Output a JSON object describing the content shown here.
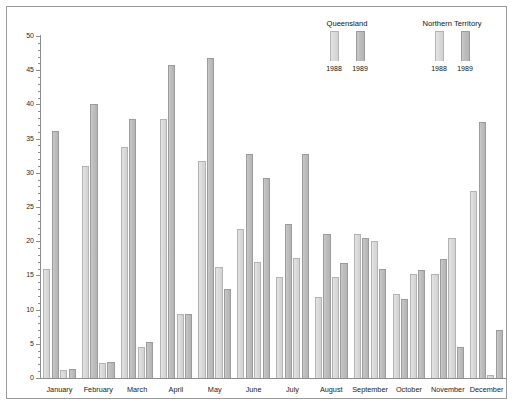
{
  "chart_data": {
    "type": "bar",
    "title": "",
    "subtitle": "",
    "xlabel": "",
    "ylabel": "",
    "ylim": [
      0,
      50
    ],
    "ytick_step": 5,
    "yticks": [
      0,
      5,
      10,
      15,
      20,
      25,
      30,
      35,
      40,
      45,
      50
    ],
    "minor_ticks": true,
    "grid": false,
    "legend_position": "top-right",
    "categories": [
      "January",
      "February",
      "March",
      "April",
      "May",
      "June",
      "July",
      "August",
      "September",
      "October",
      "November",
      "December"
    ],
    "series": [
      {
        "name": "Queensland 1988",
        "region": "Queensland",
        "year": "1988",
        "color": "#dcdcdc",
        "values": [
          16.0,
          31.0,
          33.8,
          37.8,
          31.8,
          21.8,
          14.7,
          11.9,
          21.0,
          12.3,
          15.2,
          27.3
        ]
      },
      {
        "name": "Queensland 1989",
        "region": "Queensland",
        "year": "1989",
        "color": "#bfbfbf",
        "values": [
          36.1,
          40.0,
          37.8,
          45.8,
          46.8,
          32.8,
          22.5,
          21.1,
          20.4,
          11.6,
          17.4,
          37.5
        ]
      },
      {
        "name": "Northern Territory 1988",
        "region": "Northern Territory",
        "year": "1988",
        "color": "#dcdcdc",
        "values": [
          1.1,
          2.2,
          4.5,
          9.3,
          16.2,
          17.0,
          17.6,
          14.8,
          20.0,
          15.2,
          20.5,
          0.5
        ]
      },
      {
        "name": "Northern Territory 1989",
        "region": "Northern Territory",
        "year": "1989",
        "color": "#bfbfbf",
        "values": [
          1.3,
          2.4,
          5.2,
          9.4,
          13.0,
          29.3,
          32.7,
          16.8,
          16.0,
          15.8,
          4.5,
          7.0
        ]
      }
    ]
  },
  "legend": {
    "groups": [
      {
        "title": "Queensland",
        "years": [
          "1988",
          "1989"
        ]
      },
      {
        "title": "Northern Territory",
        "years": [
          "1988",
          "1989"
        ]
      }
    ]
  }
}
